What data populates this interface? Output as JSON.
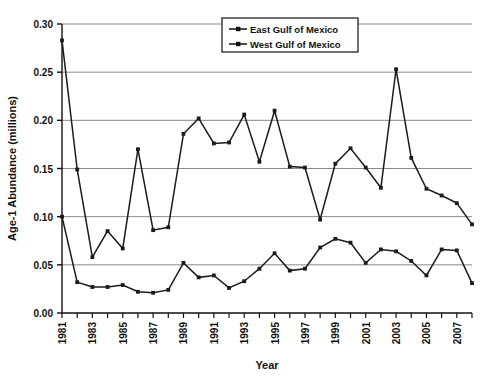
{
  "chart_data": {
    "type": "line",
    "title": "",
    "xlabel": "Year",
    "ylabel": "Age-1 Abundance (millions)",
    "xlim": [
      1981,
      2008
    ],
    "ylim": [
      0.0,
      0.3
    ],
    "ytick_values": [
      0.0,
      0.05,
      0.1,
      0.15,
      0.2,
      0.25,
      0.3
    ],
    "ytick_labels": [
      "0.00",
      "0.05",
      "0.10",
      "0.15",
      "0.20",
      "0.25",
      "0.30"
    ],
    "xtick_labels": [
      "1981",
      "1983",
      "1985",
      "1987",
      "1989",
      "1991",
      "1993",
      "1995",
      "1997",
      "1999",
      "2001",
      "2003",
      "2005",
      "2007"
    ],
    "x": [
      1981,
      1982,
      1983,
      1984,
      1985,
      1986,
      1987,
      1988,
      1989,
      1990,
      1991,
      1992,
      1993,
      1994,
      1995,
      1996,
      1997,
      1998,
      1999,
      2000,
      2001,
      2002,
      2003,
      2004,
      2005,
      2006,
      2007,
      2008
    ],
    "grid": "horizontal",
    "legend_position": "top-right",
    "marker": "square",
    "line_color": "#1a1a1a",
    "series": [
      {
        "name": "East Gulf of Mexico",
        "values": [
          0.283,
          0.149,
          0.058,
          0.085,
          0.067,
          0.17,
          0.086,
          0.089,
          0.186,
          0.202,
          0.176,
          0.177,
          0.206,
          0.157,
          0.21,
          0.152,
          0.151,
          0.097,
          0.155,
          0.171,
          0.151,
          0.13,
          0.253,
          0.161,
          0.129,
          0.122,
          0.114,
          0.092
        ]
      },
      {
        "name": "West Gulf of Mexico",
        "values": [
          0.1,
          0.032,
          0.027,
          0.027,
          0.029,
          0.022,
          0.021,
          0.024,
          0.052,
          0.037,
          0.039,
          0.026,
          0.033,
          0.046,
          0.062,
          0.044,
          0.046,
          0.068,
          0.077,
          0.073,
          0.052,
          0.066,
          0.064,
          0.054,
          0.039,
          0.066,
          0.065,
          0.031
        ]
      }
    ]
  },
  "legend": {
    "items": [
      {
        "label": "East Gulf of Mexico"
      },
      {
        "label": "West Gulf of Mexico"
      }
    ]
  }
}
